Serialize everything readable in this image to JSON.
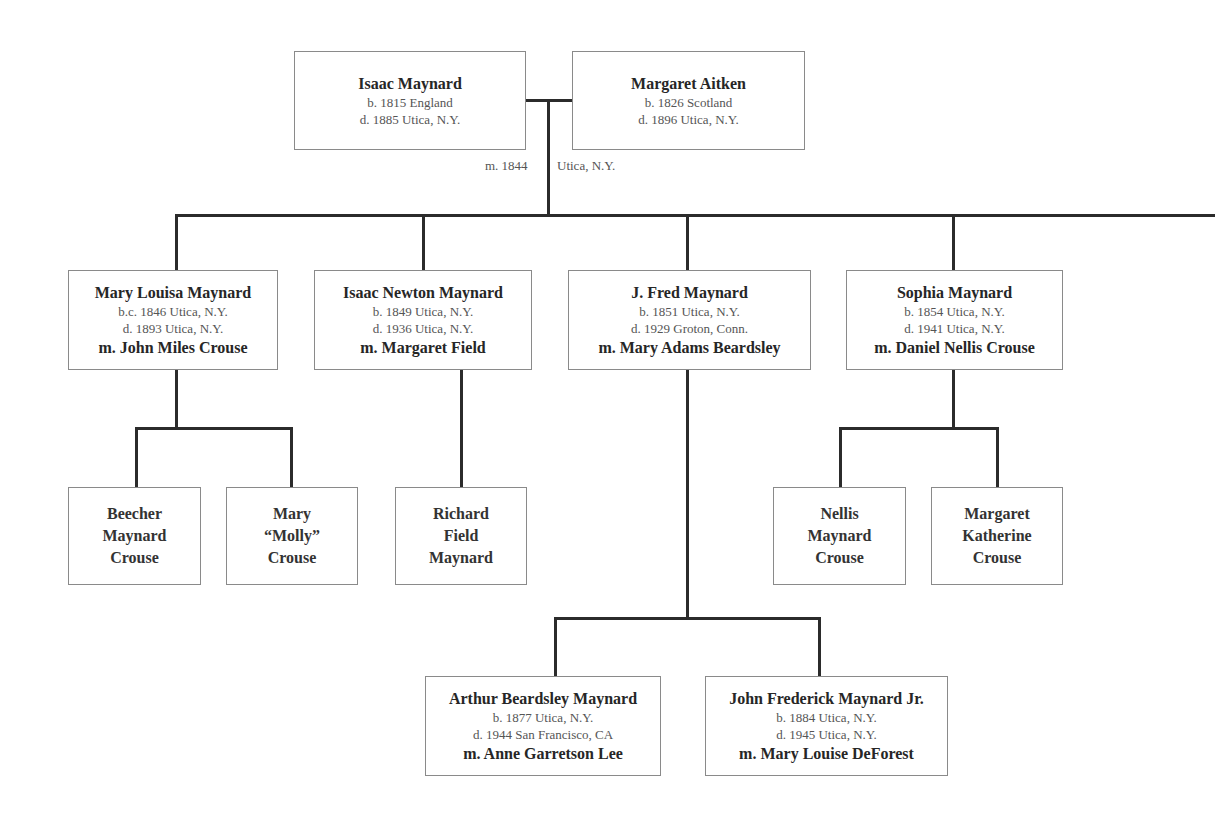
{
  "diagram": {
    "type": "family-tree",
    "root_couple": {
      "husband": {
        "name": "Isaac Maynard",
        "born": "b. 1815 England",
        "died": "d. 1885 Utica, N.Y."
      },
      "wife": {
        "name": "Margaret Aitken",
        "born": "b. 1826 Scotland",
        "died": "d. 1896 Utica, N.Y."
      },
      "marriage": {
        "year": "m. 1844",
        "place": "Utica, N.Y."
      }
    },
    "children": [
      {
        "name": "Mary Louisa Maynard",
        "born": "b.c. 1846 Utica, N.Y.",
        "died": "d. 1893 Utica, N.Y.",
        "spouse": "m. John Miles Crouse",
        "children": [
          {
            "name": "Beecher\nMaynard\nCrouse"
          },
          {
            "name": "Mary\n“Molly”\nCrouse"
          }
        ]
      },
      {
        "name": "Isaac Newton Maynard",
        "born": "b. 1849 Utica, N.Y.",
        "died": "d. 1936 Utica, N.Y.",
        "spouse": "m. Margaret Field",
        "children": [
          {
            "name": "Richard\nField\nMaynard"
          }
        ]
      },
      {
        "name": "J. Fred Maynard",
        "born": "b. 1851 Utica, N.Y.",
        "died": "d. 1929 Groton, Conn.",
        "spouse": "m. Mary Adams Beardsley",
        "children": [
          {
            "name": "Arthur Beardsley Maynard",
            "born": "b. 1877 Utica, N.Y.",
            "died": "d. 1944 San Francisco, CA",
            "spouse": "m. Anne Garretson Lee"
          },
          {
            "name": "John Frederick Maynard Jr.",
            "born": "b. 1884 Utica, N.Y.",
            "died": "d. 1945 Utica, N.Y.",
            "spouse": "m. Mary Louise DeForest"
          }
        ]
      },
      {
        "name": "Sophia Maynard",
        "born": "b. 1854 Utica, N.Y.",
        "died": "d. 1941 Utica, N.Y.",
        "spouse": "m. Daniel Nellis Crouse",
        "children": [
          {
            "name": "Nellis\nMaynard\nCrouse"
          },
          {
            "name": "Margaret\nKatherine\nCrouse"
          }
        ]
      }
    ]
  },
  "colors": {
    "line": "#2b2b2b",
    "box_border": "#8a8a8a",
    "text_primary": "#262626",
    "text_secondary": "#555555",
    "background": "#ffffff"
  }
}
